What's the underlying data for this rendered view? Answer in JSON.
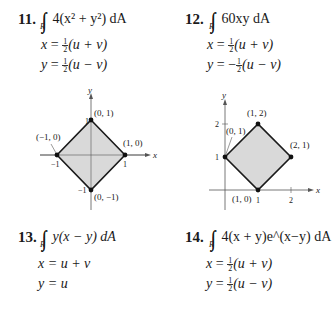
{
  "problems": [
    {
      "number": "11.",
      "integrand": "4(x² + y²) dA",
      "region": "R",
      "substitution": [
        "x = ½(u + v)",
        "y = ½(u − v)"
      ],
      "x_sub": {
        "lhs": "x",
        "coef": "1/2",
        "rhs": "(u + v)"
      },
      "y_sub": {
        "lhs": "y",
        "sign": "",
        "coef": "1/2",
        "rhs": "(u − v)"
      }
    },
    {
      "number": "12.",
      "integrand": "60xy dA",
      "region": "R",
      "substitution": [
        "x = ½(u + v)",
        "y = −½(u − v)"
      ],
      "x_sub": {
        "lhs": "x",
        "coef": "1/2",
        "rhs": "(u + v)"
      },
      "y_sub": {
        "lhs": "y",
        "sign": "−",
        "coef": "1/2",
        "rhs": "(u − v)"
      }
    },
    {
      "number": "13.",
      "integrand": "y(x − y) dA",
      "region": "R",
      "substitution": [
        "x = u + v",
        "y = u"
      ]
    },
    {
      "number": "14.",
      "integrand": "4(x + y)e^(x−y) dA",
      "region": "R",
      "substitution": [
        "x = ½(u + v)",
        "y = ½(u − v)"
      ],
      "x_sub": {
        "lhs": "x",
        "coef": "1/2",
        "rhs": "(u + v)"
      },
      "y_sub": {
        "lhs": "y",
        "sign": "",
        "coef": "1/2",
        "rhs": "(u − v)"
      }
    }
  ],
  "graphs": [
    {
      "for_problem": "11",
      "axis_labels": {
        "x": "x",
        "y": "y"
      },
      "ticks": {
        "x": [
          "−1",
          "1"
        ],
        "y": [
          "−1",
          "1"
        ]
      },
      "vertices": [
        {
          "label": "(0, 1)",
          "x": 0,
          "y": 1
        },
        {
          "label": "(1, 0)",
          "x": 1,
          "y": 0
        },
        {
          "label": "(0, −1)",
          "x": 0,
          "y": -1
        },
        {
          "label": "(−1, 0)",
          "x": -1,
          "y": 0
        }
      ],
      "fill_color": "#d9d9d9",
      "edge_color": "#1a1a1a"
    },
    {
      "for_problem": "12",
      "axis_labels": {
        "x": "x",
        "y": "y"
      },
      "ticks": {
        "x": [
          "1",
          "2"
        ],
        "y": [
          "1",
          "2"
        ]
      },
      "vertices": [
        {
          "label": "(1, 2)",
          "x": 1,
          "y": 2
        },
        {
          "label": "(2, 1)",
          "x": 2,
          "y": 1
        },
        {
          "label": "(1, 0)",
          "x": 1,
          "y": 0
        },
        {
          "label": "(0, 1)",
          "x": 0,
          "y": 1
        }
      ],
      "fill_color": "#d9d9d9",
      "edge_color": "#1a1a1a"
    }
  ]
}
